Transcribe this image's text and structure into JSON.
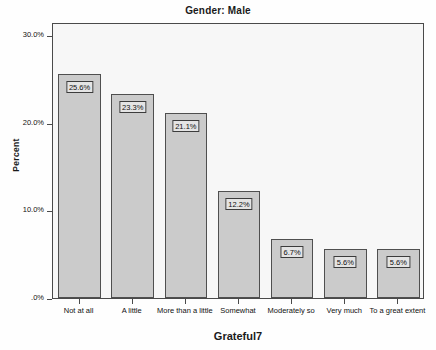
{
  "chart_data": {
    "type": "bar",
    "title": "Gender: Male",
    "xlabel": "Grateful7",
    "ylabel": "Percent",
    "categories": [
      "Not at all",
      "A little",
      "More than a little",
      "Somewhat",
      "Moderately so",
      "Very much",
      "To a great extent"
    ],
    "values": [
      25.6,
      23.3,
      21.1,
      12.2,
      6.7,
      5.6,
      5.6
    ],
    "value_labels": [
      "25.6%",
      "23.3%",
      "21.1%",
      "12.2%",
      "6.7%",
      "5.6%",
      "5.6%"
    ],
    "ylim": [
      0,
      31.5
    ],
    "y_ticks": [
      0,
      10,
      20,
      30
    ],
    "y_tick_labels": [
      ".0%",
      "10.0%",
      "20.0%",
      "30.0%"
    ],
    "grid": false,
    "legend": "none",
    "bar_fill_color": "#cbcbcb",
    "bar_border_color": "#4f4f4f",
    "plot_background_color": "#f7f7f7",
    "label_background_color": "#e4e4e4"
  }
}
